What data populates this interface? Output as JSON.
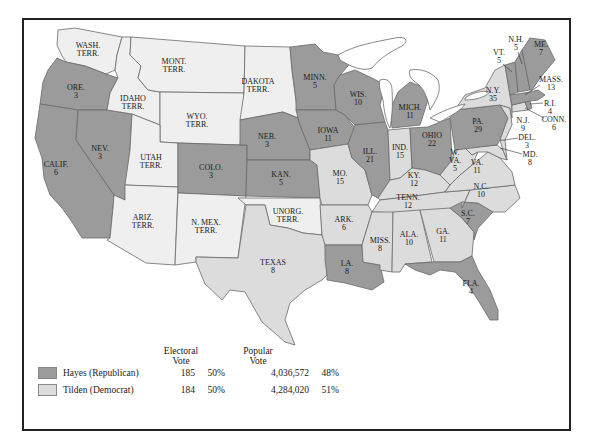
{
  "colors": {
    "hayes": "#9b9b9b",
    "tilden": "#dcdcdc",
    "territory": "#efefef",
    "border": "#6a6a6a",
    "frame": "#222222"
  },
  "legend": {
    "electoral_header_line1": "Electoral",
    "electoral_header_line2": "Vote",
    "popular_header_line1": "Popular",
    "popular_header_line2": "Vote",
    "rows": [
      {
        "party": "hayes",
        "name": "Hayes (Republican)",
        "electoral_votes": "185",
        "electoral_pct": "50%",
        "popular_votes": "4,036,572",
        "popular_pct": "48%"
      },
      {
        "party": "tilden",
        "name": "Tilden (Democrat)",
        "electoral_votes": "184",
        "electoral_pct": "50%",
        "popular_votes": "4,284,020",
        "popular_pct": "51%"
      }
    ]
  },
  "regions": {
    "wash": {
      "name": "WASH.",
      "sub": "TERR.",
      "type": "territory"
    },
    "ore": {
      "name": "ORE.",
      "sub": "3",
      "type": "hayes"
    },
    "calif": {
      "name": "CALIF.",
      "sub": "6",
      "type": "hayes"
    },
    "nev": {
      "name": "NEV.",
      "sub": "3",
      "type": "hayes"
    },
    "idaho": {
      "name": "IDAHO",
      "sub": "TERR.",
      "type": "territory"
    },
    "mont": {
      "name": "MONT.",
      "sub": "TERR.",
      "type": "territory"
    },
    "wyo": {
      "name": "WYO.",
      "sub": "TERR.",
      "type": "territory"
    },
    "utah": {
      "name": "UTAH",
      "sub": "TERR.",
      "type": "territory"
    },
    "ariz": {
      "name": "ARIZ.",
      "sub": "TERR.",
      "type": "territory"
    },
    "colo": {
      "name": "COLO.",
      "sub": "3",
      "type": "hayes"
    },
    "nmex": {
      "name": "N. MEX.",
      "sub": "TERR.",
      "type": "territory"
    },
    "dakota": {
      "name": "DAKOTA",
      "sub": "TERR.",
      "type": "territory"
    },
    "neb": {
      "name": "NEB.",
      "sub": "3",
      "type": "hayes"
    },
    "kan": {
      "name": "KAN.",
      "sub": "5",
      "type": "hayes"
    },
    "unorg": {
      "name": "UNORG.",
      "sub": "TERR.",
      "type": "territory"
    },
    "texas": {
      "name": "TEXAS",
      "sub": "8",
      "type": "tilden"
    },
    "minn": {
      "name": "MINN.",
      "sub": "5",
      "type": "hayes"
    },
    "iowa": {
      "name": "IOWA",
      "sub": "11",
      "type": "hayes"
    },
    "mo": {
      "name": "MO.",
      "sub": "15",
      "type": "tilden"
    },
    "ark": {
      "name": "ARK.",
      "sub": "6",
      "type": "tilden"
    },
    "la": {
      "name": "LA.",
      "sub": "8",
      "type": "hayes"
    },
    "wis": {
      "name": "WIS.",
      "sub": "10",
      "type": "hayes"
    },
    "ill": {
      "name": "ILL.",
      "sub": "21",
      "type": "hayes"
    },
    "mich": {
      "name": "MICH.",
      "sub": "11",
      "type": "hayes"
    },
    "ind": {
      "name": "IND.",
      "sub": "15",
      "type": "tilden"
    },
    "ohio": {
      "name": "OHIO",
      "sub": "22",
      "type": "hayes"
    },
    "ky": {
      "name": "KY.",
      "sub": "12",
      "type": "tilden"
    },
    "tenn": {
      "name": "TENN.",
      "sub": "12",
      "type": "tilden"
    },
    "miss": {
      "name": "MISS.",
      "sub": "8",
      "type": "tilden"
    },
    "ala": {
      "name": "ALA.",
      "sub": "10",
      "type": "tilden"
    },
    "ga": {
      "name": "GA.",
      "sub": "11",
      "type": "tilden"
    },
    "fla": {
      "name": "FLA.",
      "sub": "4",
      "type": "hayes"
    },
    "sc": {
      "name": "S.C.",
      "sub": "7",
      "type": "hayes"
    },
    "nc": {
      "name": "N.C.",
      "sub": "10",
      "type": "tilden"
    },
    "va": {
      "name": "VA.",
      "sub": "11",
      "type": "tilden"
    },
    "wva": {
      "name": "W.",
      "sub": "VA.",
      "sub2": "5",
      "type": "tilden"
    },
    "md": {
      "name": "MD.",
      "sub": "8",
      "type": "tilden"
    },
    "del": {
      "name": "DEL.",
      "sub": "3",
      "type": "tilden"
    },
    "pa": {
      "name": "PA.",
      "sub": "29",
      "type": "hayes"
    },
    "nj": {
      "name": "N.J.",
      "sub": "9",
      "type": "tilden"
    },
    "ny": {
      "name": "N.Y.",
      "sub": "35",
      "type": "tilden"
    },
    "conn": {
      "name": "CONN.",
      "sub": "6",
      "type": "tilden"
    },
    "ri": {
      "name": "R.I.",
      "sub": "4",
      "type": "hayes"
    },
    "mass": {
      "name": "MASS.",
      "sub": "13",
      "type": "hayes"
    },
    "vt": {
      "name": "VT.",
      "sub": "5",
      "type": "hayes"
    },
    "nh": {
      "name": "N.H.",
      "sub": "5",
      "type": "hayes"
    },
    "me": {
      "name": "ME.",
      "sub": "7",
      "type": "hayes"
    }
  }
}
